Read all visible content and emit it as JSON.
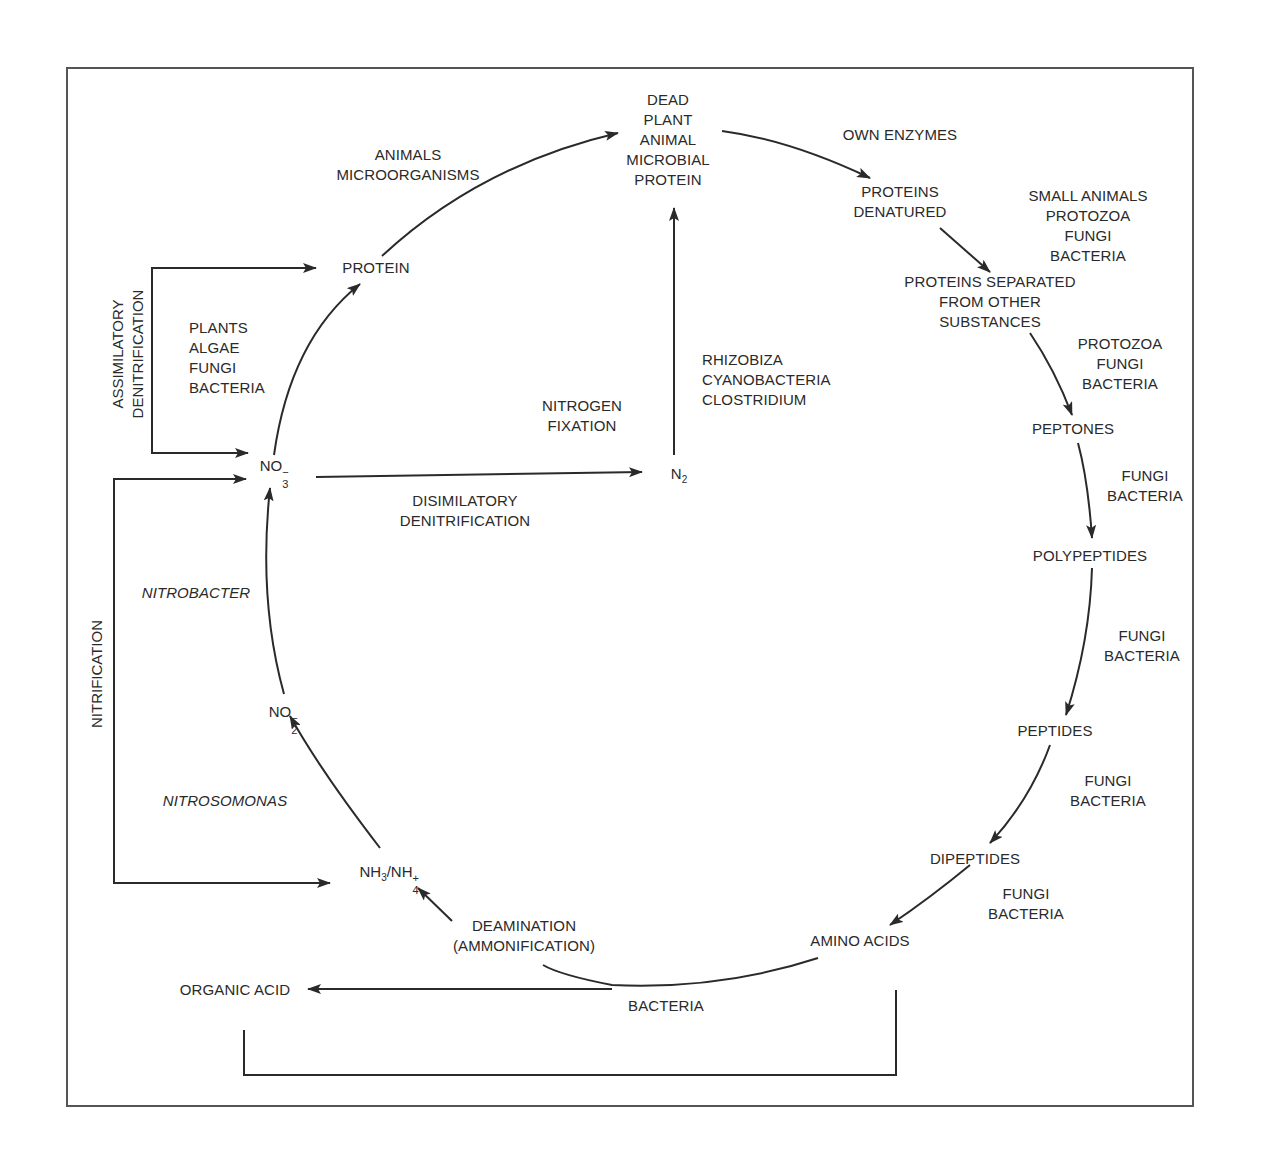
{
  "diagram": {
    "nodes": {
      "dead_protein": [
        "DEAD",
        "PLANT",
        "ANIMAL",
        "MICROBIAL",
        "PROTEIN"
      ],
      "proteins_denatured": [
        "PROTEINS",
        "DENATURED"
      ],
      "proteins_separated": [
        "PROTEINS SEPARATED",
        "FROM OTHER",
        "SUBSTANCES"
      ],
      "peptones": "PEPTONES",
      "polypeptides": "POLYPEPTIDES",
      "peptides": "PEPTIDES",
      "dipeptides": "DIPEPTIDES",
      "amino_acids": "AMINO ACIDS",
      "organic_acid": "ORGANIC ACID",
      "protein": "PROTEIN",
      "no3": {
        "base": "NO",
        "sub": "3",
        "sup": "−"
      },
      "no2": {
        "base": "NO",
        "sub": "2",
        "sup": "−"
      },
      "nh3_nh4": {
        "a": "NH",
        "a_sub": "3",
        "sep": "/",
        "b": "NH",
        "b_sub": "4",
        "b_sup": "+"
      },
      "n2": {
        "base": "N",
        "sub": "2"
      }
    },
    "agents": {
      "own_enzymes": "OWN ENZYMES",
      "small_animals": [
        "SMALL ANIMALS",
        "PROTOZOA",
        "FUNGI",
        "BACTERIA"
      ],
      "protozoa_fungi_bacteria": [
        "PROTOZOA",
        "FUNGI",
        "BACTERIA"
      ],
      "fungi_bacteria_1": [
        "FUNGI",
        "BACTERIA"
      ],
      "fungi_bacteria_2": [
        "FUNGI",
        "BACTERIA"
      ],
      "fungi_bacteria_3": [
        "FUNGI",
        "BACTERIA"
      ],
      "fungi_bacteria_4": [
        "FUNGI",
        "BACTERIA"
      ],
      "animals_micro": [
        "ANIMALS",
        "MICROORGANISMS"
      ],
      "plants": [
        "PLANTS",
        "ALGAE",
        "FUNGI",
        "BACTERIA"
      ],
      "fixers": [
        "RHIZOBIZA",
        "CYANOBACTERIA",
        "CLOSTRIDIUM"
      ],
      "nitrobacter": "NITROBACTER",
      "nitrosomonas": "NITROSOMONAS",
      "bacteria": "BACTERIA"
    },
    "processes": {
      "nitrogen_fixation": [
        "NITROGEN",
        "FIXATION"
      ],
      "disimilatory": [
        "DISIMILATORY",
        "DENITRIFICATION"
      ],
      "assimilatory": [
        "ASSIMILATORY",
        "DENITRIFICATION"
      ],
      "nitrification": "NITRIFICATION",
      "deamination": [
        "DEAMINATION",
        "(AMMONIFICATION)"
      ]
    },
    "colors": {
      "ink": "#2a2a2a",
      "frame": "#555555",
      "background": "#ffffff"
    }
  }
}
